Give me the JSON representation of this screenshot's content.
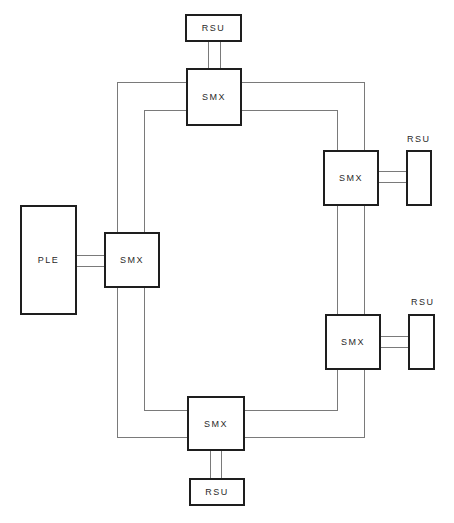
{
  "diagram": {
    "type": "ring network block diagram",
    "nodes": {
      "smx_top": {
        "label": "SMX"
      },
      "smx_right_upper": {
        "label": "SMX"
      },
      "smx_left": {
        "label": "SMX"
      },
      "smx_right_lower": {
        "label": "SMX"
      },
      "smx_bottom": {
        "label": "SMX"
      },
      "rsu_top": {
        "label": "RSU"
      },
      "rsu_right_upper": {
        "label": "RSU"
      },
      "rsu_right_lower": {
        "label": "RSU"
      },
      "rsu_bottom": {
        "label": "RSU"
      },
      "ple": {
        "label": "PLE"
      }
    },
    "connections": [
      {
        "from": "rsu_top",
        "to": "smx_top",
        "kind": "double-line link"
      },
      {
        "from": "smx_right_upper",
        "to": "rsu_right_upper",
        "kind": "double-line link"
      },
      {
        "from": "ple",
        "to": "smx_left",
        "kind": "double-line link"
      },
      {
        "from": "smx_right_lower",
        "to": "rsu_right_lower",
        "kind": "double-line link"
      },
      {
        "from": "smx_bottom",
        "to": "rsu_bottom",
        "kind": "double-line link"
      },
      {
        "ring": [
          "smx_top",
          "smx_right_upper",
          "smx_right_lower",
          "smx_bottom",
          "smx_left"
        ],
        "kind": "dual ring (outer and inner)"
      }
    ],
    "colors": {
      "line": "#7a7a7a",
      "box_border": "#1e1e1e",
      "text": "#2a2a2a",
      "background": "#ffffff"
    }
  }
}
